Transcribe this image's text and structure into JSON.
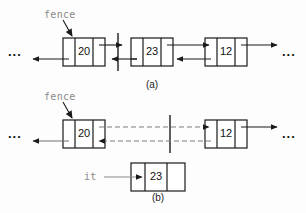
{
  "figure": {
    "background_color": "#fdfdfd",
    "line_color": "#1a1a1a",
    "gray_color": "#8a8a8a",
    "dash_color": "#7d7d7d"
  },
  "panel_a": {
    "caption": "(a)",
    "fence_label": "fence",
    "left_ellipsis": "...",
    "right_ellipsis": "...",
    "nodes": [
      {
        "value": "20"
      },
      {
        "value": "23"
      },
      {
        "value": "12"
      }
    ]
  },
  "panel_b": {
    "caption": "(b)",
    "fence_label": "fence",
    "it_label": "it",
    "left_ellipsis": "...",
    "right_ellipsis": "...",
    "nodes": [
      {
        "value": "20"
      },
      {
        "value": "12"
      }
    ],
    "detached_node": {
      "value": "23"
    }
  }
}
